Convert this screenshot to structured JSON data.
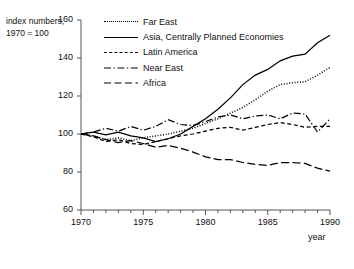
{
  "axis_title": "index numbers,\n1970 = 100",
  "legend": {
    "position": "top-center-right",
    "items": [
      {
        "label": "Far East",
        "style": "dotted",
        "key": "far-east"
      },
      {
        "label": "Asia, Centrally Planned Economies",
        "style": "solid",
        "key": "asia-cpe"
      },
      {
        "label": "Latin America",
        "style": "dashed-short",
        "key": "latin-america"
      },
      {
        "label": "Near East",
        "style": "dash-dot",
        "key": "near-east"
      },
      {
        "label": "Africa",
        "style": "dashed-long",
        "key": "africa"
      }
    ]
  },
  "xaxis": {
    "label": "year",
    "ticks": [
      "1970",
      "1975",
      "1980",
      "1985",
      "1990"
    ],
    "range": [
      1970,
      1990
    ],
    "minor_tick_interval": 1
  },
  "yaxis": {
    "ticks": [
      "60",
      "80",
      "100",
      "120",
      "140",
      "160"
    ],
    "range": [
      60,
      160
    ],
    "tick_interval": 20
  },
  "colors": {
    "line": "#000000",
    "axis": "#555555",
    "text": "#111111",
    "background": "#ffffff"
  },
  "chart_data": {
    "type": "line",
    "title": "",
    "xlabel": "year",
    "ylabel": "index numbers, 1970 = 100",
    "xlim": [
      1970,
      1990
    ],
    "ylim": [
      60,
      160
    ],
    "grid": false,
    "legend_position": "top-center-right",
    "x": [
      1970,
      1971,
      1972,
      1973,
      1974,
      1975,
      1976,
      1977,
      1978,
      1979,
      1980,
      1981,
      1982,
      1983,
      1984,
      1985,
      1986,
      1987,
      1988,
      1989,
      1990
    ],
    "series": [
      {
        "name": "Far East",
        "style": "dotted",
        "values": [
          100,
          99,
          97,
          98,
          96.5,
          98,
          99,
          100,
          101.5,
          103,
          105.5,
          108,
          111,
          114,
          118,
          122.5,
          126,
          127,
          127.5,
          131,
          135
        ]
      },
      {
        "name": "Asia, Centrally Planned Economies",
        "style": "solid",
        "values": [
          100,
          101,
          99.5,
          101,
          99,
          98,
          96,
          97.5,
          100,
          104,
          108,
          113,
          119,
          126,
          131,
          134,
          138.5,
          141,
          142,
          148,
          152
        ]
      },
      {
        "name": "Latin America",
        "style": "dashed-short",
        "values": [
          100,
          98.5,
          96,
          97,
          95,
          94.5,
          96,
          97.5,
          99,
          100,
          101.5,
          103,
          103.5,
          102,
          103.5,
          105,
          106,
          105,
          103.5,
          104,
          104
        ]
      },
      {
        "name": "Near East",
        "style": "dash-dot",
        "values": [
          100,
          101,
          103,
          101.5,
          104,
          102,
          104,
          107.5,
          105,
          104.5,
          106.5,
          109,
          110,
          108,
          109.5,
          110,
          108,
          111,
          110.5,
          101,
          108
        ]
      },
      {
        "name": "Africa",
        "style": "dashed-long",
        "values": [
          100,
          99,
          97,
          95.5,
          96.5,
          95,
          93,
          94,
          92.5,
          90.5,
          88,
          86.5,
          86.5,
          85,
          84,
          83.5,
          85,
          85,
          84.5,
          82,
          80.5
        ]
      }
    ]
  }
}
